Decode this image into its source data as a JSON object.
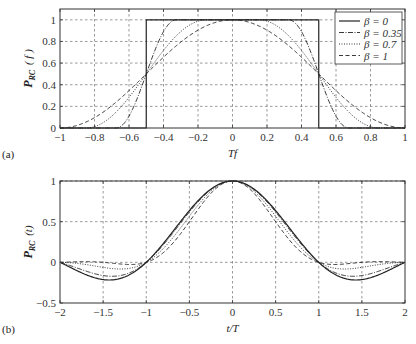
{
  "chart_data": [
    {
      "type": "line",
      "panel_label": "(a)",
      "title": "",
      "xlabel": "Tf",
      "ylabel": "P_RC(f)",
      "ylabel_main": "P",
      "ylabel_sub": "RC",
      "ylabel_arg": "( f )",
      "xlim": [
        -1,
        1
      ],
      "ylim": [
        0,
        1.1
      ],
      "grid": true,
      "grid_style": "dashed",
      "legend_position": "upper right",
      "xticks": [
        -1,
        -0.8,
        -0.6,
        -0.4,
        -0.2,
        0,
        0.2,
        0.4,
        0.6,
        0.8,
        1
      ],
      "xtick_labels": [
        "−1",
        "−0.8",
        "−0.6",
        "−0.4",
        "−0.2",
        "0",
        "0.2",
        "0.4",
        "0.6",
        "0.8",
        "1"
      ],
      "yticks": [
        0,
        0.2,
        0.4,
        0.6,
        0.8,
        1
      ],
      "ytick_labels": [
        "0",
        "0.2",
        "0.4",
        "0.6",
        "0.8",
        "1"
      ],
      "function": "raised-cosine spectrum",
      "series": [
        {
          "name": "β = 0",
          "beta": 0,
          "style": "solid",
          "x": [
            -1,
            -0.5,
            -0.5,
            0,
            0.5,
            0.5,
            1
          ],
          "values": [
            0,
            0,
            1,
            1,
            1,
            0,
            0
          ]
        },
        {
          "name": "β = 0.35",
          "beta": 0.35,
          "style": "dashdot",
          "x": [
            -1,
            -0.675,
            -0.6,
            -0.5,
            -0.4,
            -0.325,
            0,
            0.325,
            0.4,
            0.5,
            0.6,
            0.675,
            1
          ],
          "values": [
            0,
            0,
            0.15,
            0.5,
            0.85,
            1,
            1,
            1,
            0.85,
            0.5,
            0.15,
            0,
            0
          ]
        },
        {
          "name": "β = 0.7",
          "beta": 0.7,
          "style": "dotted",
          "x": [
            -1,
            -0.85,
            -0.7,
            -0.5,
            -0.3,
            -0.15,
            0,
            0.15,
            0.3,
            0.5,
            0.7,
            0.85,
            1
          ],
          "values": [
            0,
            0,
            0.15,
            0.5,
            0.85,
            1,
            1,
            1,
            0.85,
            0.5,
            0.15,
            0,
            0
          ]
        },
        {
          "name": "β = 1",
          "beta": 1,
          "style": "dashed",
          "x": [
            -1,
            -0.8,
            -0.6,
            -0.5,
            -0.4,
            -0.2,
            0,
            0.2,
            0.4,
            0.5,
            0.6,
            0.8,
            1
          ],
          "values": [
            0,
            0.1,
            0.35,
            0.5,
            0.65,
            0.9,
            1,
            0.9,
            0.65,
            0.5,
            0.35,
            0.1,
            0
          ]
        }
      ],
      "legend": [
        "β = 0",
        "β = 0.35",
        "β = 0.7",
        "β = 1"
      ]
    },
    {
      "type": "line",
      "panel_label": "(b)",
      "title": "",
      "xlabel": "t/T",
      "ylabel": "P_RC(t)",
      "ylabel_main": "P",
      "ylabel_sub": "RC",
      "ylabel_arg": "(t)",
      "xlim": [
        -2,
        2
      ],
      "ylim": [
        -0.5,
        1
      ],
      "grid": true,
      "grid_style": "dashed",
      "xticks": [
        -2,
        -1.5,
        -1,
        -0.5,
        0,
        0.5,
        1,
        1.5,
        2
      ],
      "xtick_labels": [
        "−2",
        "−1.5",
        "−1",
        "−0.5",
        "0",
        "0.5",
        "1",
        "1.5",
        "2"
      ],
      "yticks": [
        -0.5,
        0,
        0.5,
        1
      ],
      "ytick_labels": [
        "−0.5",
        "0",
        "0.5",
        "1"
      ],
      "function": "raised-cosine pulse sinc(t/T)·cos(πβt/T)/(1−(2βt/T)²)",
      "series": [
        {
          "name": "β = 0",
          "beta": 0,
          "style": "solid",
          "x": [
            -2,
            -1.5,
            -1,
            -0.5,
            0,
            0.5,
            1,
            1.5,
            2
          ],
          "values": [
            0,
            -0.21,
            0,
            0.64,
            1,
            0.64,
            0,
            -0.21,
            0
          ]
        },
        {
          "name": "β = 0.35",
          "beta": 0.35,
          "style": "dashdot",
          "x": [
            -2,
            -1.5,
            -1,
            -0.5,
            0,
            0.5,
            1,
            1.5,
            2
          ],
          "values": [
            0,
            -0.14,
            0,
            0.6,
            1,
            0.6,
            0,
            -0.14,
            0
          ]
        },
        {
          "name": "β = 0.7",
          "beta": 0.7,
          "style": "dotted",
          "x": [
            -2,
            -1.5,
            -1,
            -0.5,
            0,
            0.5,
            1,
            1.5,
            2
          ],
          "values": [
            0,
            -0.06,
            0,
            0.55,
            1,
            0.55,
            0,
            -0.06,
            0
          ]
        },
        {
          "name": "β = 1",
          "beta": 1,
          "style": "dashed",
          "x": [
            -2,
            -1.5,
            -1,
            -0.5,
            0,
            0.5,
            1,
            1.5,
            2
          ],
          "values": [
            0,
            -0.01,
            0,
            0.5,
            1,
            0.5,
            0,
            -0.01,
            0
          ]
        }
      ]
    }
  ],
  "layout": {
    "a": {
      "left": 60,
      "right": 405,
      "top": 9,
      "bottom": 128
    },
    "b": {
      "left": 60,
      "right": 405,
      "top": 181,
      "bottom": 303
    }
  },
  "colors": {
    "line": "#222222",
    "grid": "#555555",
    "axis": "#333333"
  }
}
